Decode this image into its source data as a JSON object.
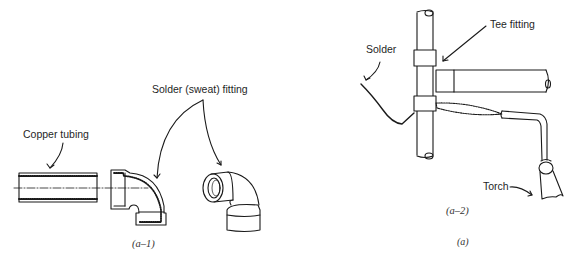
{
  "figure": {
    "panels": [
      {
        "id": "a-1",
        "caption": "(a–1)",
        "labels": {
          "copper_tubing": "Copper tubing",
          "solder_fitting": "Solder (sweat) fitting"
        }
      },
      {
        "id": "a-2",
        "caption": "(a–2)",
        "labels": {
          "solder": "Solder",
          "tee_fitting": "Tee fitting",
          "torch": "Torch"
        }
      }
    ],
    "caption": "(a)"
  }
}
